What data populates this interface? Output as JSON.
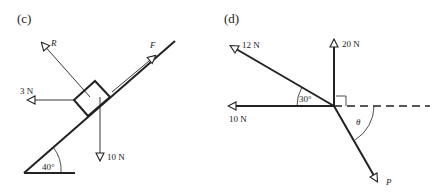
{
  "diagrams": [
    {
      "id": "c",
      "label": "(c)",
      "incline_angle_label": "40°",
      "forces": {
        "R": "R",
        "F": "F",
        "left": "3 N",
        "weight": "10 N"
      }
    },
    {
      "id": "d",
      "label": "(d)",
      "forces": {
        "upper_left": "12 N",
        "up": "20 N",
        "left": "10 N",
        "P": "P"
      },
      "angles": {
        "between_12N_and_10N": "30°",
        "theta": "θ"
      },
      "right_angle_marker": true,
      "dashed_reference_line": true
    }
  ],
  "colors": {
    "ink": "#222222",
    "background": "#ffffff"
  }
}
